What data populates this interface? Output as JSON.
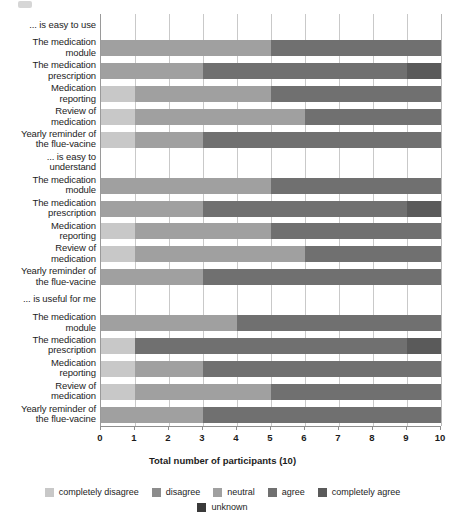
{
  "chart_data": {
    "type": "bar",
    "orientation": "horizontal",
    "stacked": true,
    "title": "",
    "xlabel": "Total number of participants (10)",
    "ylabel": "",
    "xlim": [
      0,
      10
    ],
    "xticks": [
      0,
      1,
      2,
      3,
      4,
      5,
      6,
      7,
      8,
      9,
      10
    ],
    "xticklabels": [
      "0",
      "1",
      "2",
      "3",
      "4",
      "5",
      "6",
      "7",
      "8",
      "9",
      "10"
    ],
    "grid": true,
    "legend_position": "bottom",
    "series": [
      {
        "name": "completely disagree",
        "color": "#c8c8c8"
      },
      {
        "name": "disagree",
        "color": "#8c8c8c"
      },
      {
        "name": "neutral",
        "color": "#a0a0a0"
      },
      {
        "name": "agree",
        "color": "#707070"
      },
      {
        "name": "completely agree",
        "color": "#5a5a5a"
      },
      {
        "name": "unknown",
        "color": "#3a3a3a"
      }
    ],
    "groups": [
      {
        "header": "... is easy to use",
        "categories": [
          {
            "label": "The medication\nmodule",
            "label_line1": "The medication",
            "label_line2": "module",
            "values": {
              "completely disagree": 0,
              "disagree": 0,
              "neutral": 5,
              "agree": 5,
              "completely agree": 0,
              "unknown": 0
            }
          },
          {
            "label": "The medication\nprescription",
            "label_line1": "The medication",
            "label_line2": "prescription",
            "values": {
              "completely disagree": 0,
              "disagree": 0,
              "neutral": 3,
              "agree": 6,
              "completely agree": 1,
              "unknown": 0
            }
          },
          {
            "label": "Medication\nreporting",
            "label_line1": "Medication",
            "label_line2": "reporting",
            "values": {
              "completely disagree": 1,
              "disagree": 0,
              "neutral": 4,
              "agree": 5,
              "completely agree": 0,
              "unknown": 0
            }
          },
          {
            "label": "Review of\nmedication",
            "label_line1": "Review of",
            "label_line2": "medication",
            "values": {
              "completely disagree": 1,
              "disagree": 0,
              "neutral": 5,
              "agree": 4,
              "completely agree": 0,
              "unknown": 0
            }
          },
          {
            "label": "Yearly reminder of\nthe flue-vacine",
            "label_line1": "Yearly reminder of",
            "label_line2": "the flue-vacine",
            "values": {
              "completely disagree": 1,
              "disagree": 0,
              "neutral": 2,
              "agree": 7,
              "completely agree": 0,
              "unknown": 0
            }
          }
        ]
      },
      {
        "header": "... is easy to\nunderstand",
        "header_line1": "... is easy to",
        "header_line2": "understand",
        "categories": [
          {
            "label": "The medication\nmodule",
            "label_line1": "The medication",
            "label_line2": "module",
            "values": {
              "completely disagree": 0,
              "disagree": 0,
              "neutral": 5,
              "agree": 5,
              "completely agree": 0,
              "unknown": 0
            }
          },
          {
            "label": "The medication\nprescription",
            "label_line1": "The medication",
            "label_line2": "prescription",
            "values": {
              "completely disagree": 0,
              "disagree": 0,
              "neutral": 3,
              "agree": 6,
              "completely agree": 1,
              "unknown": 0
            }
          },
          {
            "label": "Medication\nreporting",
            "label_line1": "Medication",
            "label_line2": "reporting",
            "values": {
              "completely disagree": 1,
              "disagree": 0,
              "neutral": 4,
              "agree": 5,
              "completely agree": 0,
              "unknown": 0
            }
          },
          {
            "label": "Review of\nmedication",
            "label_line1": "Review of",
            "label_line2": "medication",
            "values": {
              "completely disagree": 1,
              "disagree": 0,
              "neutral": 5,
              "agree": 4,
              "completely agree": 0,
              "unknown": 0
            }
          },
          {
            "label": "Yearly reminder of\nthe flue-vacine",
            "label_line1": "Yearly reminder of",
            "label_line2": "the flue-vacine",
            "values": {
              "completely disagree": 0,
              "disagree": 0,
              "neutral": 3,
              "agree": 7,
              "completely agree": 0,
              "unknown": 0
            }
          }
        ]
      },
      {
        "header": "... is useful for me",
        "categories": [
          {
            "label": "The medication\nmodule",
            "label_line1": "The medication",
            "label_line2": "module",
            "values": {
              "completely disagree": 0,
              "disagree": 0,
              "neutral": 4,
              "agree": 6,
              "completely agree": 0,
              "unknown": 0
            }
          },
          {
            "label": "The medication\nprescription",
            "label_line1": "The medication",
            "label_line2": "prescription",
            "values": {
              "completely disagree": 1,
              "disagree": 0,
              "neutral": 0,
              "agree": 8,
              "completely agree": 1,
              "unknown": 0
            }
          },
          {
            "label": "Medication\nreporting",
            "label_line1": "Medication",
            "label_line2": "reporting",
            "values": {
              "completely disagree": 1,
              "disagree": 0,
              "neutral": 2,
              "agree": 7,
              "completely agree": 0,
              "unknown": 0
            }
          },
          {
            "label": "Review of\nmedication",
            "label_line1": "Review of",
            "label_line2": "medication",
            "values": {
              "completely disagree": 1,
              "disagree": 0,
              "neutral": 4,
              "agree": 5,
              "completely agree": 0,
              "unknown": 0
            }
          },
          {
            "label": "Yearly reminder of\nthe flue-vacine",
            "label_line1": "Yearly reminder of",
            "label_line2": "the flue-vacine",
            "values": {
              "completely disagree": 0,
              "disagree": 0,
              "neutral": 3,
              "agree": 7,
              "completely agree": 0,
              "unknown": 0
            }
          }
        ]
      }
    ],
    "legend": [
      {
        "label": "completely disagree",
        "color": "#c8c8c8"
      },
      {
        "label": "disagree",
        "color": "#8c8c8c"
      },
      {
        "label": "neutral",
        "color": "#a0a0a0"
      },
      {
        "label": "agree",
        "color": "#707070"
      },
      {
        "label": "completely agree",
        "color": "#5a5a5a"
      },
      {
        "label": "unknown",
        "color": "#3a3a3a"
      }
    ],
    "legend_rows": [
      [
        "completely disagree",
        "disagree",
        "neutral",
        "agree",
        "completely agree"
      ],
      [
        "unknown"
      ]
    ]
  }
}
